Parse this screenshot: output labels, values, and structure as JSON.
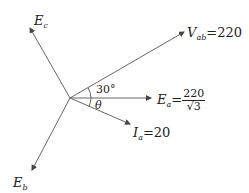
{
  "diagram": {
    "type": "phasor-diagram",
    "phasors": [
      {
        "name": "E_c",
        "base": "E",
        "sub": "c",
        "value": ""
      },
      {
        "name": "V_ab",
        "base": "V",
        "sub": "ab",
        "eq": "=220"
      },
      {
        "name": "E_a",
        "base": "E",
        "sub": "a",
        "eq": "=",
        "num": "220",
        "den": "√3"
      },
      {
        "name": "I_a",
        "base": "I",
        "sub": "a",
        "eq": "=20"
      },
      {
        "name": "E_b",
        "base": "E",
        "sub": "b",
        "value": ""
      }
    ],
    "angles": [
      {
        "label": "30°",
        "between": [
          "E_a",
          "V_ab"
        ]
      },
      {
        "label": "θ",
        "between": [
          "E_a",
          "I_a"
        ]
      }
    ],
    "colors": {
      "line": "#666666",
      "text": "#222222"
    }
  }
}
